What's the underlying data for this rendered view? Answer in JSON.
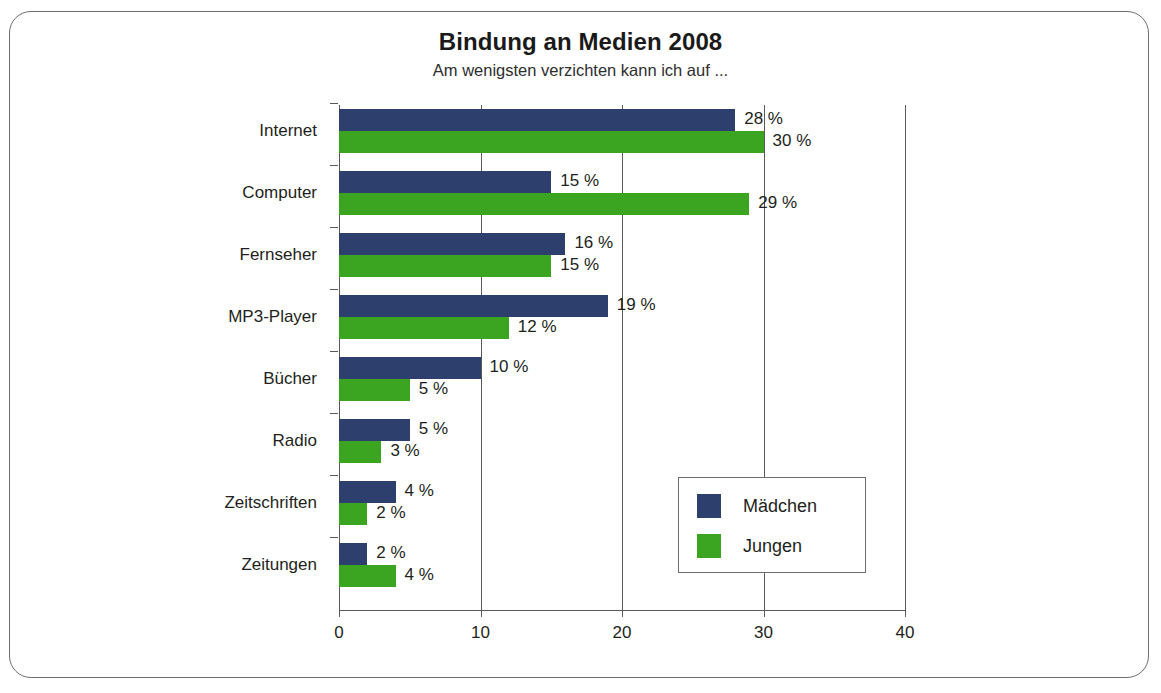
{
  "chart_data": {
    "type": "bar",
    "orientation": "horizontal",
    "title": "Bindung an Medien 2008",
    "subtitle": "Am wenigsten verzichten kann ich auf ...",
    "xlabel": "",
    "ylabel": "",
    "xlim": [
      0,
      40
    ],
    "xticks": [
      "0",
      "10",
      "20",
      "30",
      "40"
    ],
    "xtick_values": [
      0,
      10,
      20,
      30,
      40
    ],
    "grid": true,
    "grid_axis": "x",
    "legend_position": "inside-lower-right",
    "value_suffix": " %",
    "categories": [
      "Internet",
      "Computer",
      "Fernseher",
      "MP3-Player",
      "Bücher",
      "Radio",
      "Zeitschriften",
      "Zeitungen"
    ],
    "series": [
      {
        "name": "Mädchen",
        "color": "#2c3f6d",
        "values": [
          28,
          15,
          16,
          19,
          10,
          5,
          4,
          2
        ],
        "labels": [
          "28 %",
          "15 %",
          "16 %",
          "19 %",
          "10 %",
          "5 %",
          "4 %",
          "2 %"
        ]
      },
      {
        "name": "Jungen",
        "color": "#3ba521",
        "values": [
          30,
          29,
          15,
          12,
          5,
          3,
          2,
          4
        ],
        "labels": [
          "30 %",
          "29 %",
          "15 %",
          "12 %",
          "5 %",
          "3 %",
          "2 %",
          "4 %"
        ]
      }
    ]
  },
  "legend": {
    "items": [
      {
        "label": "Mädchen",
        "color": "#2c3f6d"
      },
      {
        "label": "Jungen",
        "color": "#3ba521"
      }
    ]
  },
  "colors": {
    "girls": "#2c3f6d",
    "boys": "#3ba521",
    "axis": "#58595b",
    "frame": "#6d6e71",
    "text": "#231f20"
  }
}
